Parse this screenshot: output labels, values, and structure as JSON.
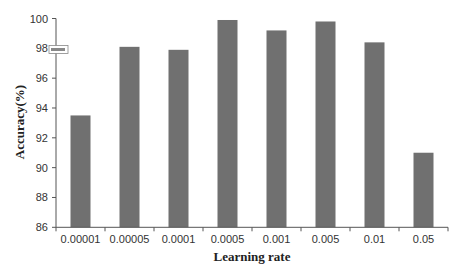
{
  "chart_data": {
    "type": "bar",
    "title": "",
    "xlabel": "Learning rate",
    "ylabel": "Accuracy(%)",
    "categories": [
      "0.00001",
      "0.00005",
      "0.0001",
      "0.0005",
      "0.001",
      "0.005",
      "0.01",
      "0.05"
    ],
    "values": [
      93.5,
      98.1,
      97.9,
      99.9,
      99.2,
      99.8,
      98.4,
      91.0
    ],
    "ylim": [
      86,
      100
    ],
    "yticks": [
      86,
      88,
      90,
      92,
      94,
      96,
      98,
      100
    ],
    "grid": false,
    "legend": "none",
    "bar_color": "#707070"
  }
}
